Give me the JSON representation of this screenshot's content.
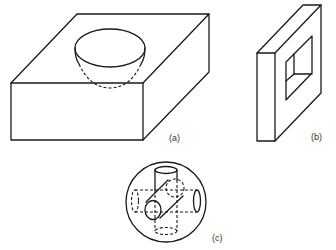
{
  "figure": {
    "panels": [
      {
        "id": "a",
        "label": "(a)",
        "description": "Rectangular block with a hemispherical cavity in its top face"
      },
      {
        "id": "b",
        "label": "(b)",
        "description": "Thick square plate with a square through-hole"
      },
      {
        "id": "c",
        "label": "(c)",
        "description": "Sphere pierced by three intersecting cylindrical holes (vertical, horizontal, diagonal)"
      }
    ],
    "colors": {
      "line": "#1a1a1a",
      "label": "#333333",
      "background": "#ffffff"
    }
  }
}
